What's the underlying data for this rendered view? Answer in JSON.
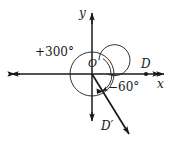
{
  "figure": {
    "kind": "coterminal-angle-diagram",
    "background_color": "#ffffff",
    "stroke_color": "#1a1a1a",
    "width": 173,
    "height": 147,
    "axes": {
      "origin": {
        "x": 92,
        "y": 74
      },
      "x_axis": {
        "label": "x",
        "left_end": {
          "x": 9,
          "y": 74
        },
        "right_end": {
          "x": 166,
          "y": 74
        },
        "arrows": "both"
      },
      "y_axis": {
        "label": "y",
        "top_end": {
          "x": 92,
          "y": 11
        },
        "bottom_end": {
          "x": 92,
          "y": 123
        },
        "arrows": "both"
      }
    },
    "origin_label": "O",
    "circle": {
      "center_x": 92,
      "center_y": 74,
      "radius": 22
    },
    "point_D": {
      "label": "D",
      "x": 146,
      "y": 74,
      "dot_radius": 2.1
    },
    "point_Dprime": {
      "label": "D′"
    },
    "terminal_ray": {
      "from_x": 92,
      "from_y": 74,
      "to_x": 132,
      "to_y": 139,
      "angle_degrees": -60
    },
    "angle_labels": {
      "positive": "+300°",
      "negative": "−60°"
    },
    "arc_positive": {
      "start_degrees": 0,
      "sweep_degrees": 300,
      "direction": "counterclockwise"
    },
    "arc_negative": {
      "start_degrees": 0,
      "sweep_degrees": -60,
      "direction": "clockwise"
    }
  }
}
